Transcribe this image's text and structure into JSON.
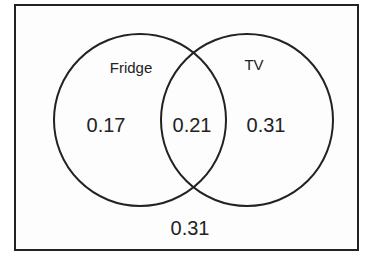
{
  "diagram": {
    "type": "venn",
    "sets": [
      {
        "name": "Fridge",
        "only_value": "0.17"
      },
      {
        "name": "TV",
        "only_value": "0.31"
      }
    ],
    "intersection_value": "0.21",
    "outside_value": "0.31",
    "stroke_color": "#222222"
  }
}
